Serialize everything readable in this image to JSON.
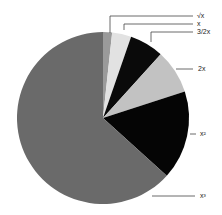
{
  "chart_data": {
    "type": "pie",
    "title": "",
    "start_angle_deg": 0,
    "direction": "clockwise",
    "slices": [
      {
        "label": "√x",
        "value": 1.7,
        "color": "#9a9a9a"
      },
      {
        "label": "x",
        "value": 3.6,
        "color": "#e2e2e2"
      },
      {
        "label": "3/2x",
        "value": 6.4,
        "color": "#0a0a0a"
      },
      {
        "label": "2x",
        "value": 8.3,
        "color": "#c2c2c2"
      },
      {
        "label": "x²",
        "value": 16.7,
        "color": "#050505"
      },
      {
        "label": "x³",
        "value": 63.3,
        "color": "#6a6a6a"
      }
    ],
    "legend": "leader-line labels on right side"
  },
  "geometry": {
    "cx": 103,
    "cy": 118,
    "r": 86
  },
  "labels": [
    {
      "text": "√x",
      "x": 197,
      "y": 18,
      "line": [
        [
          110,
          33
        ],
        [
          110,
          16
        ],
        [
          193,
          16
        ]
      ]
    },
    {
      "text": "x",
      "x": 197,
      "y": 26,
      "line": [
        [
          124,
          30
        ],
        [
          124,
          24
        ],
        [
          193,
          24
        ]
      ]
    },
    {
      "text": "3/2x",
      "x": 197,
      "y": 34,
      "line": [
        [
          151,
          42
        ],
        [
          151,
          32
        ],
        [
          193,
          32
        ]
      ]
    },
    {
      "text": "2x",
      "x": 198,
      "y": 71,
      "line": [
        [
          176,
          69
        ],
        [
          193,
          69
        ]
      ]
    },
    {
      "text": "x²",
      "x": 200,
      "y": 136,
      "line": [
        [
          190,
          134
        ],
        [
          196,
          134
        ]
      ]
    },
    {
      "text": "x³",
      "x": 200,
      "y": 198,
      "line": [
        [
          152,
          196
        ],
        [
          195,
          196
        ]
      ]
    }
  ]
}
